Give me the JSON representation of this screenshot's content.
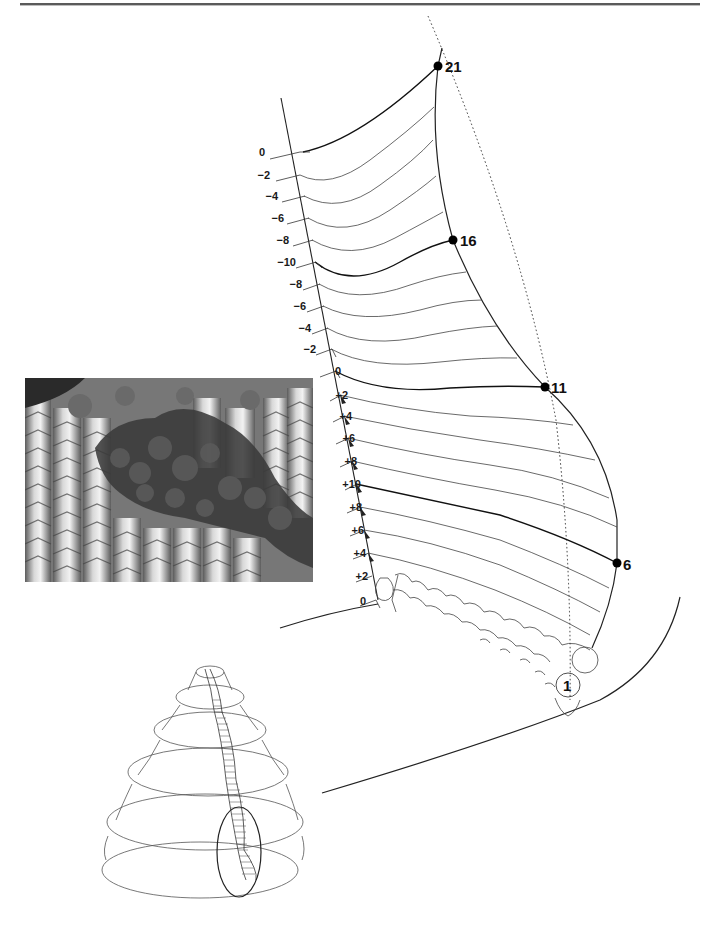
{
  "figure": {
    "type": "scientific illustration",
    "left_axis": {
      "labels": [
        "0",
        "−2",
        "−4",
        "−6",
        "−8",
        "−10",
        "−8",
        "−6",
        "−4",
        "−2",
        "0",
        "+2",
        "+4",
        "+6",
        "+8",
        "+10",
        "+8",
        "+6",
        "+4",
        "+2",
        "0"
      ],
      "label_y": [
        152,
        175,
        196,
        218,
        240,
        262,
        284,
        306,
        328,
        349,
        371,
        395,
        416,
        438,
        461,
        484,
        507,
        530,
        553,
        576,
        600
      ]
    },
    "growth_points": [
      {
        "label": "21",
        "x": 438,
        "y": 66
      },
      {
        "label": "16",
        "x": 453,
        "y": 240
      },
      {
        "label": "11",
        "x": 545,
        "y": 387
      },
      {
        "label": "6",
        "x": 617,
        "y": 563
      },
      {
        "label": "1",
        "x": 568,
        "y": 685
      }
    ],
    "photo": {
      "description": "scanning electron micrograph of ridged textured surface with dark rough crust"
    },
    "cone_illustration": {
      "description": "stacked conical tiers with hatched spiral band and circled lower section"
    }
  },
  "colors": {
    "ink": "#1a1a1a",
    "thin_line": "#444444",
    "paper": "#ffffff"
  }
}
